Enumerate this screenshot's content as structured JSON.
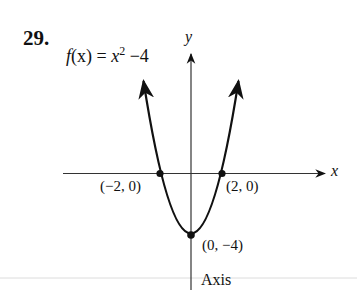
{
  "problem": {
    "number": "29.",
    "function_label": {
      "lhs_f": "f",
      "lhs_x": "(x)",
      "equals": " = ",
      "var": "x",
      "exp": "2",
      "tail": " −4"
    }
  },
  "axes": {
    "x_label": "x",
    "y_label": "y",
    "axis_caption": "Axis"
  },
  "points": [
    {
      "label": "(−2, 0)",
      "x": -2,
      "y": 0
    },
    {
      "label": "(2, 0)",
      "x": 2,
      "y": 0
    },
    {
      "label": "(0, −4)",
      "x": 0,
      "y": -4
    }
  ],
  "curve": {
    "equation": "f(x) = x^2 - 4",
    "type": "parabola",
    "vertex": [
      0,
      -4
    ],
    "x_intercepts": [
      -2,
      2
    ],
    "axis_of_symmetry": "x = 0"
  },
  "colors": {
    "ink": "#111111",
    "axis": "#333333",
    "rule": "#d8d8d8"
  }
}
